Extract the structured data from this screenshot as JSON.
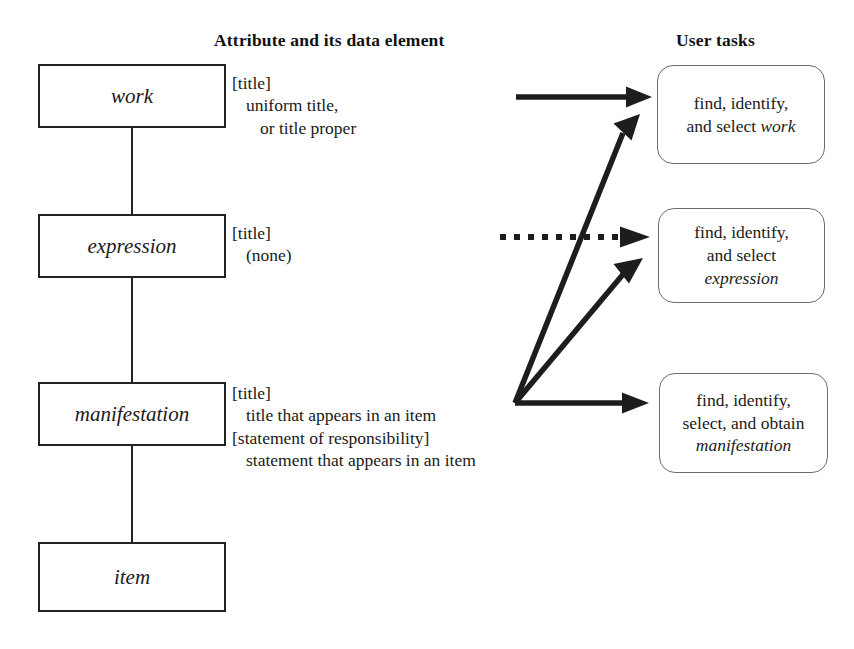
{
  "headers": {
    "attribute": "Attribute and its data element",
    "user_tasks": "User tasks"
  },
  "entities": [
    {
      "id": "work",
      "label": "work"
    },
    {
      "id": "expression",
      "label": "expression"
    },
    {
      "id": "manifestation",
      "label": "manifestation"
    },
    {
      "id": "item",
      "label": "item"
    }
  ],
  "attributes": {
    "work": {
      "key": "[title]",
      "value1": "uniform title,",
      "value2": "or title proper"
    },
    "expression": {
      "key": "[title]",
      "value1": "(none)"
    },
    "manifestation": {
      "key1": "[title]",
      "value1": "title that appears in an item",
      "key2": "[statement of responsibility]",
      "value2": "statement that appears in an item"
    }
  },
  "tasks": {
    "work": {
      "line1": "find, identify,",
      "line2_plain": "and select ",
      "line2_italic": "work"
    },
    "expression": {
      "line1": "find, identify,",
      "line2": "and select",
      "line3_italic": "expression"
    },
    "manifestation": {
      "line1": "find, identify,",
      "line2": "select, and obtain",
      "line3_italic": "manifestation"
    }
  },
  "arrows": [
    {
      "id": "arrow-work-solid",
      "style": "solid",
      "from": "manifestation-attr-area",
      "to": "task-work-direct"
    },
    {
      "id": "arrow-expression-dotted",
      "style": "dotted",
      "from": "expression-attr-area",
      "to": "task-expression"
    },
    {
      "id": "arrow-fan-to-work",
      "style": "solid",
      "from": "fan-origin",
      "to": "task-work"
    },
    {
      "id": "arrow-fan-to-expression",
      "style": "solid",
      "from": "fan-origin",
      "to": "task-expression"
    },
    {
      "id": "arrow-fan-to-manifestation",
      "style": "solid",
      "from": "fan-origin",
      "to": "task-manifestation"
    }
  ],
  "colors": {
    "line": "#222222",
    "box_border": "#222222",
    "task_border": "#6d6d6d",
    "text": "#1a1a1a",
    "background": "#ffffff"
  }
}
